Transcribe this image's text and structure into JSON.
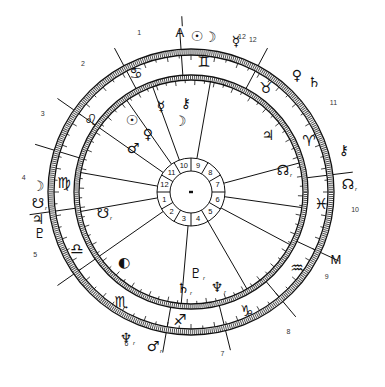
{
  "chart": {
    "type": "bi-wheel astrological natal chart",
    "center": [
      191,
      192
    ],
    "outer_ring": {
      "r_outer": 143,
      "r_inner": 137
    },
    "inner_ring": {
      "r_outer": 117,
      "r_inner": 112
    },
    "hub": {
      "r_outer": 34,
      "r_inner": 21
    },
    "colors": {
      "ink": "#111111",
      "background": "#ffffff",
      "house_number": "#333333"
    }
  },
  "angles": [
    {
      "label": "A",
      "name": "ascendant",
      "angle": -4,
      "radius": 160
    },
    {
      "label": "M",
      "name": "midheaven",
      "angle": 115,
      "radius": 160
    }
  ],
  "outer_house_numbers": [
    {
      "n": "1",
      "angle": -18,
      "radius": 168
    },
    {
      "n": "2",
      "angle": -40,
      "radius": 168
    },
    {
      "n": "3",
      "angle": -62,
      "radius": 168
    },
    {
      "n": "4",
      "angle": -85,
      "radius": 168
    },
    {
      "n": "5",
      "angle": -112,
      "radius": 168
    },
    {
      "n": "6",
      "angle": -157,
      "radius": 165
    },
    {
      "n": "7",
      "angle": 169,
      "radius": 165
    },
    {
      "n": "8",
      "angle": 145,
      "radius": 170
    },
    {
      "n": "9",
      "angle": 122,
      "radius": 160
    },
    {
      "n": "10",
      "angle": 96,
      "radius": 165
    },
    {
      "n": "11",
      "angle": 58,
      "radius": 168
    },
    {
      "n": "12",
      "angle": 22,
      "radius": 165
    }
  ],
  "outer_cusps": [
    -4,
    -28,
    -55,
    -73,
    -98,
    -125,
    -170,
    166,
    140,
    115,
    83,
    28
  ],
  "inner_cusps": [
    -20,
    -35,
    -55,
    -80,
    -100,
    -125,
    -175,
    150,
    118,
    98,
    75,
    10
  ],
  "hub_spokes": [
    0,
    30,
    60,
    90,
    120,
    150,
    180,
    210,
    240,
    270,
    300,
    330
  ],
  "hub_numbers": [
    {
      "n": "10",
      "angle": -15
    },
    {
      "n": "9",
      "angle": 15
    },
    {
      "n": "8",
      "angle": 45
    },
    {
      "n": "7",
      "angle": 75
    },
    {
      "n": "6",
      "angle": 105
    },
    {
      "n": "5",
      "angle": 135
    },
    {
      "n": "4",
      "angle": 165
    },
    {
      "n": "3",
      "angle": 195
    },
    {
      "n": "2",
      "angle": 225
    },
    {
      "n": "1",
      "angle": 255
    },
    {
      "n": "12",
      "angle": 285
    },
    {
      "n": "11",
      "angle": 315
    }
  ],
  "zodiac_signs": [
    {
      "name": "gemini",
      "glyph": "♊",
      "x": 204,
      "y": 62
    },
    {
      "name": "cancer",
      "glyph": "♋",
      "x": 136,
      "y": 73
    },
    {
      "name": "taurus",
      "glyph": "♉",
      "x": 266,
      "y": 88
    },
    {
      "name": "aries",
      "glyph": "♈",
      "x": 309,
      "y": 141
    },
    {
      "name": "leo",
      "glyph": "♌",
      "x": 91,
      "y": 120
    },
    {
      "name": "virgo",
      "glyph": "♍",
      "x": 64,
      "y": 183
    },
    {
      "name": "pisces",
      "glyph": "♓",
      "x": 321,
      "y": 204
    },
    {
      "name": "libra",
      "glyph": "♎",
      "x": 77,
      "y": 249
    },
    {
      "name": "aquarius",
      "glyph": "♒",
      "x": 297,
      "y": 268
    },
    {
      "name": "scorpio",
      "glyph": "♏",
      "x": 121,
      "y": 302
    },
    {
      "name": "capricorn",
      "glyph": "♑",
      "x": 247,
      "y": 311
    },
    {
      "name": "sagittarius",
      "glyph": "♐",
      "x": 180,
      "y": 320
    }
  ],
  "outer_planets": [
    {
      "name": "sun",
      "glyph": "☉",
      "x": 197,
      "y": 36,
      "retro": false
    },
    {
      "name": "moon",
      "glyph": "☽",
      "x": 210,
      "y": 37,
      "retro": false
    },
    {
      "name": "mercury",
      "glyph": "☿",
      "x": 236,
      "y": 41,
      "retro": false,
      "note": "12"
    },
    {
      "name": "venus",
      "glyph": "♀",
      "x": 297,
      "y": 75,
      "retro": false
    },
    {
      "name": "saturn",
      "glyph": "♄",
      "x": 314,
      "y": 82,
      "retro": false
    },
    {
      "name": "chiron",
      "glyph": "⚷",
      "x": 344,
      "y": 150,
      "retro": false
    },
    {
      "name": "node",
      "glyph": "☊",
      "x": 348,
      "y": 184,
      "retro": true
    },
    {
      "name": "moon",
      "glyph": "☽",
      "x": 38,
      "y": 186,
      "retro": false
    },
    {
      "name": "south-node",
      "glyph": "☋",
      "x": 38,
      "y": 203,
      "retro": true
    },
    {
      "name": "jupiter",
      "glyph": "♃",
      "x": 38,
      "y": 219,
      "retro": false
    },
    {
      "name": "pluto",
      "glyph": "♇",
      "x": 40,
      "y": 233,
      "retro": false
    },
    {
      "name": "neptune",
      "glyph": "♆",
      "x": 126,
      "y": 338,
      "retro": true
    },
    {
      "name": "mars",
      "glyph": "♂",
      "x": 153,
      "y": 346,
      "retro": true
    }
  ],
  "inner_planets": [
    {
      "name": "mercury",
      "glyph": "☿",
      "x": 161,
      "y": 106,
      "retro": false
    },
    {
      "name": "chiron",
      "glyph": "⚷",
      "x": 186,
      "y": 103,
      "retro": false
    },
    {
      "name": "sun",
      "glyph": "☉",
      "x": 132,
      "y": 120,
      "retro": false
    },
    {
      "name": "moon",
      "glyph": "☽",
      "x": 180,
      "y": 121,
      "retro": false
    },
    {
      "name": "venus",
      "glyph": "♀",
      "x": 148,
      "y": 134,
      "retro": false
    },
    {
      "name": "mars",
      "glyph": "♂",
      "x": 133,
      "y": 148,
      "retro": false
    },
    {
      "name": "jupiter",
      "glyph": "♃",
      "x": 268,
      "y": 135,
      "retro": false
    },
    {
      "name": "node",
      "glyph": "☊",
      "x": 283,
      "y": 170,
      "retro": true
    },
    {
      "name": "south-node",
      "glyph": "☋",
      "x": 103,
      "y": 213,
      "retro": true
    },
    {
      "name": "moon-full",
      "glyph": "◐",
      "x": 124,
      "y": 262,
      "retro": false
    },
    {
      "name": "pluto",
      "glyph": "♇",
      "x": 196,
      "y": 273,
      "retro": true
    },
    {
      "name": "saturn",
      "glyph": "♄",
      "x": 183,
      "y": 288,
      "retro": true
    },
    {
      "name": "neptune",
      "glyph": "♆",
      "x": 217,
      "y": 287,
      "retro": true
    }
  ]
}
